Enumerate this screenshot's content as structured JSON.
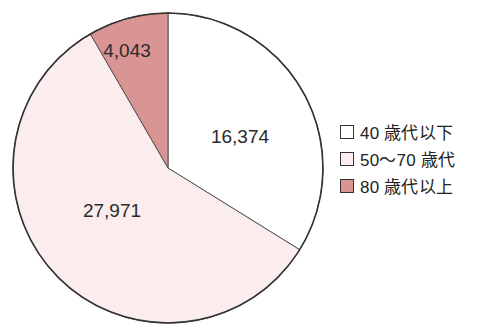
{
  "chart_data": {
    "type": "pie",
    "title": "",
    "categories": [
      "40 歳代以下",
      "50〜70 歳代",
      "80 歳代以上"
    ],
    "values": [
      16374,
      27971,
      4043
    ],
    "value_labels": [
      "16,374",
      "27,971",
      "4,043"
    ],
    "colors": [
      "#ffffff",
      "#fbeced",
      "#d99593"
    ],
    "start_angle_deg": 0,
    "direction": "clockwise",
    "legend_position": "right"
  },
  "legend": {
    "items": [
      {
        "label": "40 歳代以下",
        "color": "#ffffff"
      },
      {
        "label": "50〜70 歳代",
        "color": "#fbeced"
      },
      {
        "label": "80 歳代以上",
        "color": "#d99593"
      }
    ]
  }
}
